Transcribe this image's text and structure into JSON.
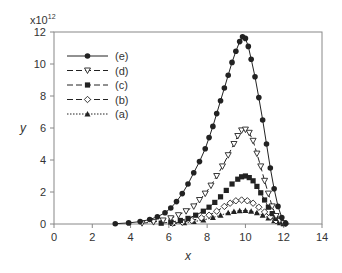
{
  "chart_data": {
    "type": "line",
    "title": "",
    "xlabel": "x",
    "ylabel": "y",
    "y_multiplier_label": "x10",
    "y_multiplier_exp": "12",
    "xlim": [
      0,
      14
    ],
    "ylim": [
      0,
      12
    ],
    "x_ticks": [
      "0",
      "2",
      "4",
      "6",
      "8",
      "10",
      "12",
      "14"
    ],
    "y_ticks": [
      "0",
      "2",
      "4",
      "6",
      "8",
      "10",
      "12"
    ],
    "grid": false,
    "legend_position": "upper-left",
    "series": [
      {
        "name": "(e)",
        "marker": "filled-circle",
        "line": "solid",
        "x": [
          3.2,
          3.9,
          4.5,
          5.0,
          5.4,
          5.8,
          6.1,
          6.4,
          6.7,
          7.0,
          7.3,
          7.6,
          7.9,
          8.1,
          8.3,
          8.5,
          8.7,
          8.9,
          9.1,
          9.3,
          9.5,
          9.7,
          9.85,
          10.0,
          10.15,
          10.3,
          10.5,
          10.7,
          10.9,
          11.1,
          11.3,
          11.5,
          11.7,
          11.9,
          12.1
        ],
        "y": [
          0.02,
          0.07,
          0.15,
          0.28,
          0.45,
          0.7,
          1.0,
          1.4,
          1.9,
          2.5,
          3.2,
          3.9,
          4.7,
          5.4,
          6.1,
          6.9,
          7.7,
          8.5,
          9.3,
          10.1,
          10.8,
          11.4,
          11.7,
          11.6,
          11.1,
          10.3,
          9.2,
          7.9,
          6.5,
          5.0,
          3.5,
          2.2,
          1.1,
          0.4,
          0.05
        ]
      },
      {
        "name": "(d)",
        "marker": "open-triangle-down",
        "line": "dashed",
        "x": [
          4.6,
          5.2,
          5.7,
          6.1,
          6.5,
          6.9,
          7.3,
          7.6,
          7.9,
          8.2,
          8.5,
          8.8,
          9.1,
          9.4,
          9.6,
          9.8,
          10.0,
          10.2,
          10.4,
          10.6,
          10.8,
          11.0,
          11.2,
          11.4,
          11.6,
          11.8,
          12.0
        ],
        "y": [
          0.05,
          0.12,
          0.22,
          0.36,
          0.55,
          0.8,
          1.1,
          1.5,
          1.9,
          2.4,
          3.0,
          3.6,
          4.3,
          5.0,
          5.5,
          5.85,
          5.9,
          5.7,
          5.2,
          4.4,
          3.6,
          2.7,
          1.9,
          1.1,
          0.5,
          0.2,
          0.05
        ]
      },
      {
        "name": "(c)",
        "marker": "filled-square",
        "line": "dashed",
        "x": [
          5.6,
          6.1,
          6.6,
          7.0,
          7.4,
          7.8,
          8.1,
          8.4,
          8.7,
          9.0,
          9.3,
          9.6,
          9.8,
          10.0,
          10.2,
          10.4,
          10.6,
          10.8,
          11.0,
          11.2,
          11.4,
          11.6,
          11.8,
          12.0
        ],
        "y": [
          0.05,
          0.12,
          0.22,
          0.35,
          0.55,
          0.8,
          1.05,
          1.35,
          1.7,
          2.1,
          2.5,
          2.8,
          2.95,
          3.0,
          2.9,
          2.7,
          2.35,
          1.95,
          1.5,
          1.05,
          0.65,
          0.35,
          0.15,
          0.04
        ]
      },
      {
        "name": "(b)",
        "marker": "open-diamond",
        "line": "dashed",
        "x": [
          6.2,
          6.7,
          7.2,
          7.7,
          8.1,
          8.5,
          8.9,
          9.2,
          9.5,
          9.8,
          10.1,
          10.4,
          10.7,
          11.0,
          11.3,
          11.6,
          11.9,
          12.1
        ],
        "y": [
          0.05,
          0.12,
          0.22,
          0.38,
          0.55,
          0.8,
          1.1,
          1.3,
          1.45,
          1.5,
          1.45,
          1.3,
          1.05,
          0.75,
          0.45,
          0.2,
          0.07,
          0.02
        ]
      },
      {
        "name": "(a)",
        "marker": "filled-triangle-up",
        "line": "dotted",
        "x": [
          6.2,
          6.8,
          7.3,
          7.8,
          8.3,
          8.7,
          9.1,
          9.4,
          9.7,
          10.0,
          10.3,
          10.6,
          10.9,
          11.2,
          11.5,
          11.8,
          12.0
        ],
        "y": [
          0.03,
          0.08,
          0.15,
          0.25,
          0.4,
          0.55,
          0.7,
          0.78,
          0.83,
          0.85,
          0.8,
          0.7,
          0.55,
          0.38,
          0.2,
          0.08,
          0.02
        ]
      }
    ]
  },
  "legend": {
    "items": [
      {
        "label": "(e)"
      },
      {
        "label": "(d)"
      },
      {
        "label": "(c)"
      },
      {
        "label": "(b)"
      },
      {
        "label": "(a)"
      }
    ]
  },
  "axes": {
    "xlabel": "x",
    "ylabel": "y",
    "multiplier_base": "x10",
    "multiplier_exp": "12"
  },
  "colors": {
    "line": "#222222",
    "axis": "#888888",
    "text": "#333333"
  }
}
